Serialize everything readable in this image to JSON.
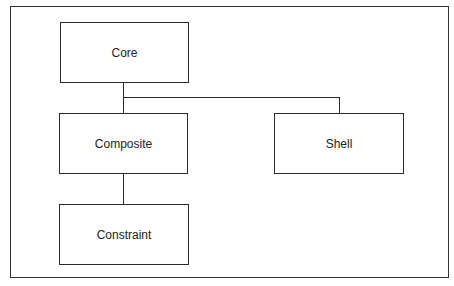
{
  "diagram": {
    "type": "tree",
    "nodes": [
      {
        "id": "core",
        "label": "Core"
      },
      {
        "id": "composite",
        "label": "Composite"
      },
      {
        "id": "shell",
        "label": "Shell"
      },
      {
        "id": "constraint",
        "label": "Constraint"
      }
    ],
    "edges": [
      {
        "from": "core",
        "to": "composite"
      },
      {
        "from": "core",
        "to": "shell"
      },
      {
        "from": "composite",
        "to": "constraint"
      }
    ]
  },
  "colors": {
    "stroke": "#2a2a2a",
    "background": "#ffffff",
    "text": "#222222"
  }
}
